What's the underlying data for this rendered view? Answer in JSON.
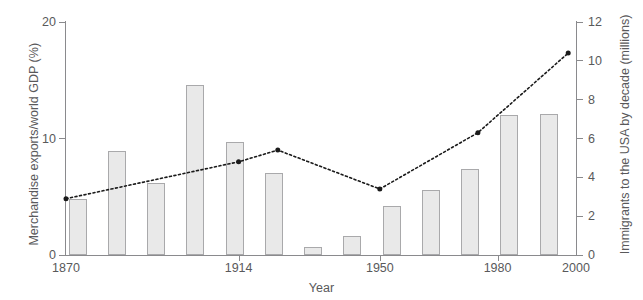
{
  "chart_data": {
    "type": "bar",
    "title": "",
    "xlabel": "Year",
    "ylabel": "Merchandise exports/world GDP (%)",
    "y2label": "Immigrants to the USA by decade (millions)",
    "xlim": [
      1870,
      2000
    ],
    "ylim": [
      0,
      20
    ],
    "y2lim": [
      0,
      12
    ],
    "grid": false,
    "legend": "none",
    "x_tick_labels": [
      "1870",
      "1914",
      "1950",
      "1980",
      "2000"
    ],
    "x_tick_values": [
      1870,
      1914,
      1950,
      1980,
      2000
    ],
    "y_tick_labels": [
      "0",
      "10",
      "20"
    ],
    "y_tick_values": [
      0,
      10,
      20
    ],
    "y2_tick_labels": [
      "0",
      "2",
      "4",
      "6",
      "8",
      "10",
      "12"
    ],
    "y2_tick_values": [
      0,
      2,
      4,
      6,
      8,
      10,
      12
    ],
    "series": [
      {
        "name": "Merchandise exports/world GDP (%)",
        "type": "bar",
        "axis": "left",
        "color": "#e9e9e9",
        "edge_color": "#a9a9ab",
        "x": [
          1873,
          1883,
          1893,
          1903,
          1913,
          1923,
          1933,
          1943,
          1953,
          1963,
          1973,
          1983,
          1993
        ],
        "values": [
          4.8,
          8.9,
          6.2,
          14.6,
          9.7,
          7.0,
          0.7,
          1.6,
          4.2,
          5.6,
          7.4,
          12.0,
          12.1
        ]
      },
      {
        "name": "Immigrants to the USA by decade (millions)",
        "type": "line",
        "style": "dotted",
        "axis": "right",
        "color": "#1a1a1a",
        "marker": "filled-circle",
        "x": [
          1870,
          1914,
          1924,
          1950,
          1975,
          1998
        ],
        "values": [
          2.9,
          4.8,
          5.4,
          3.4,
          6.3,
          10.4
        ]
      }
    ]
  },
  "axes": {
    "left_title": "Merchandise exports/world GDP (%)",
    "right_title": "Immigrants to the USA by decade (millions)",
    "bottom_title": "Year"
  },
  "colors": {
    "bar_fill": "#e9e9e9",
    "bar_edge": "#a9a9ab",
    "axis": "#8a8a8d",
    "text": "#59595b",
    "line": "#1a1a1a",
    "background": "#ffffff"
  }
}
